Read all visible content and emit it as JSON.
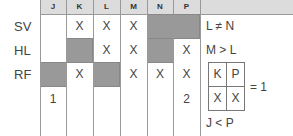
{
  "columns": [
    "J",
    "K",
    "L",
    "M",
    "N",
    "P"
  ],
  "rows": [
    {
      "label": "SV",
      "cells": [
        "",
        "X",
        "X",
        "X",
        "",
        ""
      ]
    },
    {
      "label": "HL",
      "cells": [
        "",
        "",
        "X",
        "X",
        "",
        "X"
      ]
    },
    {
      "label": "RF",
      "cells": [
        "",
        "X",
        "",
        "X",
        "X",
        "X"
      ]
    },
    {
      "label": "",
      "cells": [
        "1",
        "",
        "",
        "",
        "",
        "2"
      ]
    }
  ],
  "shaded": [
    {
      "row": 0,
      "col": 4
    },
    {
      "row": 0,
      "col": 5
    },
    {
      "row": 1,
      "col": 1
    },
    {
      "row": 1,
      "col": 4
    },
    {
      "row": 2,
      "col": 0
    },
    {
      "row": 2,
      "col": 2
    }
  ],
  "notes": {
    "rule1": "L ≠ N",
    "rule2": "M > L",
    "mini_table": {
      "headers": [
        "K",
        "P"
      ],
      "values": [
        "X",
        "X"
      ],
      "result": "= 1"
    },
    "rule3": "J < P"
  },
  "colors": {
    "shade": "#999999",
    "header": "#dcdcdc",
    "line": "#999999"
  }
}
